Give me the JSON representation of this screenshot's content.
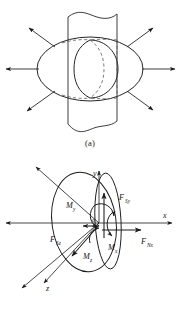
{
  "figure": {
    "panels": [
      {
        "id": "a",
        "caption": "(a)",
        "description": "sphere-in-channel with radiating flow arrows",
        "labels": []
      },
      {
        "id": "b",
        "caption": "(b)",
        "description": "free body diagram of curved surface with force and moment components",
        "axes": {
          "x": "x",
          "y": "y",
          "z": "z",
          "origin": "o"
        },
        "forces": [
          {
            "name": "F-Sy",
            "base": "F",
            "sub": "Sy"
          },
          {
            "name": "F-Nx",
            "base": "F",
            "sub": "Nx"
          },
          {
            "name": "F-Sz",
            "base": "F",
            "sub": "Sz"
          }
        ],
        "moments": [
          {
            "name": "M-y",
            "base": "M",
            "sub": "y"
          },
          {
            "name": "M-x",
            "base": "M",
            "sub": "x"
          },
          {
            "name": "M-z",
            "base": "M",
            "sub": "z"
          }
        ]
      }
    ]
  },
  "colors": {
    "line": "#1a1a1a",
    "dashed": "#555555",
    "background": "#ffffff",
    "text": "#151515"
  }
}
